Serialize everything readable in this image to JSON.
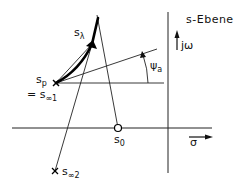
{
  "diagram": {
    "title": "s-Ebene",
    "axes": {
      "imag_label": "jω",
      "real_label": "σ"
    },
    "points": {
      "s_p": {
        "base": "s",
        "sub": "p",
        "marker": "cross"
      },
      "s_inf1": {
        "prefix": "= ",
        "base": "s",
        "sub": "∞1"
      },
      "s_lambda": {
        "base": "s",
        "sub": "λ",
        "marker": "filled-arrow"
      },
      "s_0": {
        "base": "s",
        "sub": "0",
        "marker": "circle"
      },
      "s_inf2": {
        "base": "s",
        "sub": "∞2",
        "marker": "cross"
      }
    },
    "angle": {
      "base": "ψ",
      "sub": "a"
    },
    "colors": {
      "ink": "#111111",
      "background": "#ffffff"
    }
  }
}
